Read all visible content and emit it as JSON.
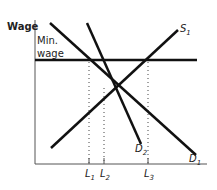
{
  "diagram": {
    "y_axis_label": "Wage",
    "min_wage_label_line1": "Min.",
    "min_wage_label_line2": "wage",
    "curves": {
      "supply": {
        "name": "S",
        "sub": "1"
      },
      "demand1": {
        "name": "D",
        "sub": "1"
      },
      "demand2": {
        "name": "D",
        "sub": "2"
      }
    },
    "x_ticks": [
      {
        "name": "L",
        "sub": "1"
      },
      {
        "name": "L",
        "sub": "2"
      },
      {
        "name": "L",
        "sub": "3"
      }
    ],
    "colors": {
      "line": "#111111",
      "text": "#222222",
      "background": "#ffffff"
    }
  }
}
